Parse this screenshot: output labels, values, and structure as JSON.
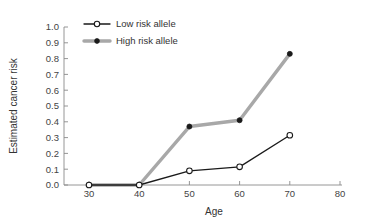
{
  "chart_data": {
    "type": "line",
    "title": "",
    "xlabel": "Age",
    "ylabel": "Estimated cancer risk",
    "x": [
      30,
      40,
      50,
      60,
      70
    ],
    "xlim": [
      27,
      82
    ],
    "ylim": [
      0.0,
      1.0
    ],
    "xticks": [
      "30",
      "40",
      "50",
      "60",
      "70",
      "80"
    ],
    "xtick_values": [
      30,
      40,
      50,
      60,
      70,
      80
    ],
    "yticks": [
      "0.0",
      "0.1",
      "0.2",
      "0.3",
      "0.4",
      "0.5",
      "0.6",
      "0.7",
      "0.8",
      "0.9",
      "1.0"
    ],
    "ytick_values": [
      0.0,
      0.1,
      0.2,
      0.3,
      0.4,
      0.5,
      0.6,
      0.7,
      0.8,
      0.9,
      1.0
    ],
    "grid": false,
    "legend_position": "top-left",
    "series": [
      {
        "name": "Low risk allele",
        "values": [
          0.0,
          0.0,
          0.09,
          0.115,
          0.315
        ],
        "color": "#1a1a1a",
        "line_width": 1.3,
        "marker": "open-circle",
        "marker_fill": "#ffffff",
        "marker_edge": "#1a1a1a"
      },
      {
        "name": "High risk allele",
        "values": [
          0.0,
          0.0,
          0.37,
          0.41,
          0.83
        ],
        "color": "#a8a8a8",
        "line_width": 3.4,
        "marker": "filled-circle",
        "marker_fill": "#1a1a1a",
        "marker_edge": "#1a1a1a"
      }
    ]
  },
  "legend": {
    "items": [
      {
        "label": "Low risk allele"
      },
      {
        "label": "High risk allele"
      }
    ]
  },
  "axes": {
    "x_title": "Age",
    "y_title": "Estimated cancer risk"
  }
}
